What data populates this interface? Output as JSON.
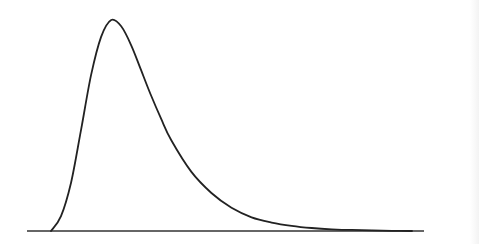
{
  "chart_data": {
    "type": "line",
    "title": "",
    "xlabel": "",
    "ylabel": "",
    "grid": false,
    "legend": null,
    "xlim": [
      0,
      10
    ],
    "ylim": [
      0,
      1
    ],
    "series": [
      {
        "name": "density",
        "color": "#222222",
        "x": [
          0.0,
          0.25,
          0.5,
          0.75,
          1.0,
          1.25,
          1.5,
          1.75,
          2.0,
          2.25,
          2.5,
          2.75,
          3.0,
          3.5,
          4.0,
          4.5,
          5.0,
          5.5,
          6.0,
          6.5,
          7.0,
          7.5,
          8.0,
          8.5,
          9.0
        ],
        "values": [
          0.0,
          0.07,
          0.23,
          0.48,
          0.74,
          0.92,
          1.0,
          0.97,
          0.88,
          0.76,
          0.64,
          0.53,
          0.43,
          0.28,
          0.18,
          0.11,
          0.065,
          0.04,
          0.024,
          0.014,
          0.008,
          0.005,
          0.003,
          0.001,
          0.0
        ]
      }
    ],
    "baseline": {
      "y": 0,
      "x_start": -1.0,
      "x_end": 9.6,
      "color": "#333333"
    }
  },
  "layout": {
    "plot_left_px": 51,
    "plot_right_px": 412,
    "baseline_y_px": 231,
    "peak_y_px": 20,
    "axis_left_px": 27,
    "axis_right_px": 424
  }
}
